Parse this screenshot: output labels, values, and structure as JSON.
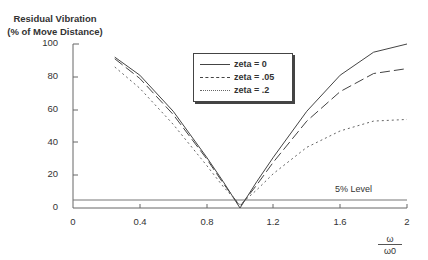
{
  "chart_data": {
    "type": "line",
    "title": "",
    "ylabel": "Residual Vibration (% of Move Distance)",
    "ylabel_lines": [
      "Residual Vibration",
      "(% of Move Distance)"
    ],
    "xlabel": "ω/ω0",
    "xlabel_num": "ω",
    "xlabel_den": "ω0",
    "xlim": [
      0,
      2
    ],
    "ylim": [
      0,
      100
    ],
    "xticks": [
      "0",
      "0.4",
      "0.8",
      "1.2",
      "1.6",
      "2"
    ],
    "xtick_values": [
      0,
      0.4,
      0.8,
      1.2,
      1.6,
      2
    ],
    "yticks": [
      "0",
      "20",
      "40",
      "60",
      "80",
      "100"
    ],
    "ytick_values": [
      0,
      20,
      40,
      60,
      80,
      100
    ],
    "grid": false,
    "legend_position": "upper center",
    "x": [
      0.25,
      0.4,
      0.6,
      0.8,
      0.9,
      1.0,
      1.1,
      1.2,
      1.4,
      1.6,
      1.8,
      2.0
    ],
    "series": [
      {
        "name": "zeta = 0",
        "style": "solid",
        "values": [
          92,
          81,
          59,
          31,
          16,
          0,
          16,
          31,
          59,
          81,
          95,
          100
        ]
      },
      {
        "name": "zeta = .05",
        "style": "dashed",
        "values": [
          91,
          79,
          57,
          30,
          15,
          1,
          14,
          28,
          53,
          71,
          82,
          85
        ]
      },
      {
        "name": "zeta = .2",
        "style": "dotted",
        "values": [
          86,
          73,
          51,
          26,
          13,
          2,
          11,
          21,
          37,
          47,
          53,
          54
        ]
      }
    ],
    "annotations": [
      {
        "text": "5% Level",
        "type": "hline",
        "y": 5
      }
    ]
  }
}
